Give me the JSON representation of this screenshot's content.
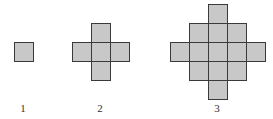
{
  "diagram": {
    "cell_size": 19,
    "cell_fill": "#c8c8c8",
    "stroke": "#3a3a3a",
    "figures": [
      {
        "label": "1",
        "label_x": 23,
        "origin": [
          14,
          42
        ],
        "cells": [
          [
            0,
            0
          ]
        ]
      },
      {
        "label": "2",
        "label_x": 100,
        "origin": [
          72,
          23
        ],
        "cells": [
          [
            1,
            0
          ],
          [
            0,
            1
          ],
          [
            1,
            1
          ],
          [
            2,
            1
          ],
          [
            1,
            2
          ]
        ]
      },
      {
        "label": "3",
        "label_x": 217,
        "origin": [
          170,
          4
        ],
        "cells": [
          [
            2,
            0
          ],
          [
            1,
            1
          ],
          [
            2,
            1
          ],
          [
            3,
            1
          ],
          [
            0,
            2
          ],
          [
            1,
            2
          ],
          [
            2,
            2
          ],
          [
            3,
            2
          ],
          [
            4,
            2
          ],
          [
            1,
            3
          ],
          [
            2,
            3
          ],
          [
            3,
            3
          ],
          [
            2,
            4
          ]
        ]
      }
    ],
    "label_y": 103
  }
}
